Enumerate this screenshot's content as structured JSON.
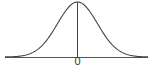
{
  "diagram": {
    "type": "normal-distribution-curve",
    "mean_label": "0",
    "colors": {
      "curve": "#444444",
      "axis": "#555555",
      "mean_line": "#444444",
      "background": "#ffffff"
    }
  }
}
